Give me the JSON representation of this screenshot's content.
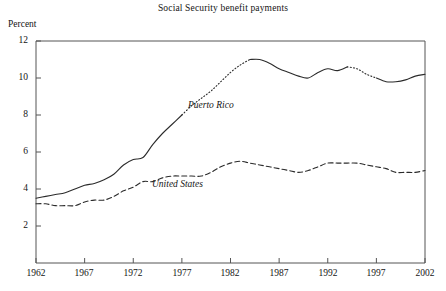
{
  "chart_data": {
    "type": "line",
    "title": "Social Security benefit payments",
    "xlabel": "",
    "ylabel": "Percent",
    "xlim": [
      1962,
      2002
    ],
    "ylim": [
      0,
      12
    ],
    "grid": false,
    "legend_position": "inline-annotation",
    "yticks": [
      2,
      4,
      6,
      8,
      10,
      12
    ],
    "xticks": [
      1962,
      1967,
      1972,
      1977,
      1982,
      1987,
      1992,
      1997,
      2002
    ],
    "x": [
      1962,
      1963,
      1964,
      1965,
      1966,
      1967,
      1968,
      1969,
      1970,
      1971,
      1972,
      1973,
      1974,
      1975,
      1976,
      1977,
      1978,
      1979,
      1980,
      1981,
      1982,
      1983,
      1984,
      1985,
      1986,
      1987,
      1988,
      1989,
      1990,
      1991,
      1992,
      1993,
      1994,
      1995,
      1996,
      1997,
      1998,
      1999,
      2000,
      2001,
      2002
    ],
    "series": [
      {
        "name": "Puerto Rico",
        "style": "solid",
        "color": "#2b2b2b",
        "values": [
          3.5,
          3.6,
          3.7,
          3.8,
          4.0,
          4.2,
          4.3,
          4.5,
          4.8,
          5.3,
          5.6,
          5.7,
          6.4,
          7.0,
          7.5,
          8.0,
          8.5,
          8.9,
          9.3,
          9.8,
          10.3,
          10.7,
          11.0,
          11.0,
          10.8,
          10.5,
          10.3,
          10.1,
          10.0,
          10.3,
          10.5,
          10.4,
          10.6,
          10.5,
          10.2,
          10.0,
          9.8,
          9.8,
          9.9,
          10.1,
          10.2
        ],
        "dotted_segments": [
          [
            1977,
            1984
          ],
          [
            1994,
            1997
          ]
        ]
      },
      {
        "name": "United States",
        "style": "dashed",
        "color": "#2b2b2b",
        "values": [
          3.2,
          3.2,
          3.1,
          3.1,
          3.1,
          3.3,
          3.4,
          3.4,
          3.6,
          3.9,
          4.1,
          4.4,
          4.4,
          4.6,
          4.7,
          4.7,
          4.7,
          4.7,
          4.9,
          5.2,
          5.4,
          5.5,
          5.4,
          5.3,
          5.2,
          5.1,
          5.0,
          4.9,
          5.0,
          5.2,
          5.4,
          5.4,
          5.4,
          5.4,
          5.3,
          5.2,
          5.1,
          4.9,
          4.9,
          4.9,
          5.0
        ],
        "dotted_segments": []
      }
    ],
    "annotations": [
      {
        "text": "Puerto Rico",
        "x_px": 188,
        "y_px": 100
      },
      {
        "text": "United States",
        "x_px": 152,
        "y_px": 179
      }
    ]
  },
  "axis": {
    "ylabel": "Percent",
    "ytick_labels": [
      "12",
      "10",
      "8",
      "6",
      "4",
      "2"
    ],
    "xtick_labels": [
      "1962",
      "1967",
      "1972",
      "1977",
      "1982",
      "1987",
      "1992",
      "1997",
      "2002"
    ]
  },
  "colors": {
    "line": "#2b2b2b",
    "axis": "#555555",
    "text": "#141414",
    "background": "#ffffff"
  }
}
